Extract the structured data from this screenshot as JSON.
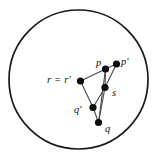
{
  "figure": {
    "background_color": "#ffffff",
    "boundary": {
      "shape": "circle",
      "center_x": 78.5,
      "center_y": 79.5,
      "radius": 69.5,
      "stroke_color": "#1a1a1a",
      "stroke_width": 1.7
    },
    "node_color": "#0d0d0d",
    "edge_color": "#4d4d4d",
    "node_radius": 3.6
  },
  "nodes": [
    {
      "id": "r",
      "label": "r = r′",
      "x": 80.5,
      "y": 81.0,
      "label_x": 47,
      "label_y": 74.5,
      "label_kind": "eq"
    },
    {
      "id": "p",
      "label": "p",
      "x": 105.5,
      "y": 69.0,
      "label_x": 96,
      "label_y": 57.5,
      "label_kind": "plain"
    },
    {
      "id": "pp",
      "label": "p′",
      "x": 116.5,
      "y": 64.0,
      "label_x": 121,
      "label_y": 56.5,
      "label_kind": "plain"
    },
    {
      "id": "s",
      "label": "s",
      "x": 105.0,
      "y": 87.5,
      "label_x": 112,
      "label_y": 87.5,
      "label_kind": "plain"
    },
    {
      "id": "qp",
      "label": "q′",
      "x": 93.0,
      "y": 107.5,
      "label_x": 74,
      "label_y": 104.5,
      "label_kind": "plain"
    },
    {
      "id": "q",
      "label": "q",
      "x": 98.5,
      "y": 122.5,
      "label_x": 105,
      "label_y": 123.5,
      "label_kind": "plain"
    }
  ],
  "edges": [
    {
      "from": "r",
      "to": "p"
    },
    {
      "from": "r",
      "to": "qp"
    },
    {
      "from": "p",
      "to": "pp"
    },
    {
      "from": "p",
      "to": "s"
    },
    {
      "from": "pp",
      "to": "s"
    },
    {
      "from": "s",
      "to": "qp"
    },
    {
      "from": "s",
      "to": "q"
    },
    {
      "from": "qp",
      "to": "q"
    },
    {
      "from": "p",
      "to": "q"
    }
  ]
}
